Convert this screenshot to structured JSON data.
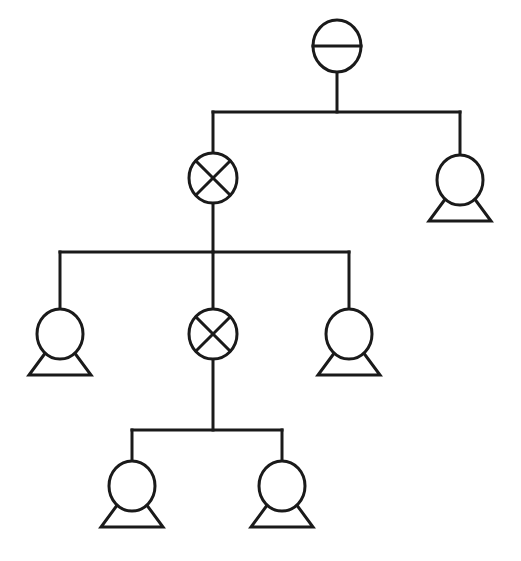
{
  "diagram": {
    "type": "tree",
    "title": "",
    "colors": {
      "stroke": "#1a1a1a",
      "background": "#ffffff"
    },
    "nodes": [
      {
        "id": "root",
        "symbol": "circle-horizontal-bar",
        "cx": 337,
        "cy": 46
      },
      {
        "id": "cross-1",
        "symbol": "circle-x",
        "cx": 213,
        "cy": 178,
        "parent": "root"
      },
      {
        "id": "pump-1",
        "symbol": "pump",
        "cx": 460,
        "cy": 180,
        "parent": "root"
      },
      {
        "id": "pump-2",
        "symbol": "pump",
        "cx": 60,
        "cy": 334,
        "parent": "cross-1"
      },
      {
        "id": "cross-2",
        "symbol": "circle-x",
        "cx": 213,
        "cy": 334,
        "parent": "cross-1"
      },
      {
        "id": "pump-3",
        "symbol": "pump",
        "cx": 349,
        "cy": 334,
        "parent": "cross-1"
      },
      {
        "id": "pump-4",
        "symbol": "pump",
        "cx": 132,
        "cy": 486,
        "parent": "cross-2"
      },
      {
        "id": "pump-5",
        "symbol": "pump",
        "cx": 282,
        "cy": 486,
        "parent": "cross-2"
      }
    ],
    "connectors": [
      {
        "from": "root",
        "bus_y": 112,
        "x1": 213,
        "x2": 460
      },
      {
        "from": "cross-1",
        "bus_y": 252,
        "x1": 60,
        "x2": 349
      },
      {
        "from": "cross-2",
        "bus_y": 430,
        "x1": 132,
        "x2": 282
      }
    ]
  }
}
